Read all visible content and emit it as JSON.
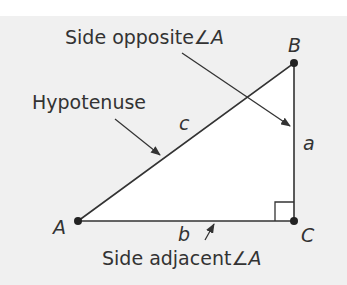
{
  "diagram": {
    "colors": {
      "background": "#f0f0f0",
      "triangle_fill": "#ffffff",
      "stroke": "#333333"
    },
    "vertices": [
      {
        "name": "A",
        "label": "A"
      },
      {
        "name": "B",
        "label": "B"
      },
      {
        "name": "C",
        "label": "C"
      }
    ],
    "sides": {
      "a": "a",
      "b": "b",
      "c": "c"
    },
    "annotations": {
      "opposite": "Side opposite",
      "hypotenuse": "Hypotenuse",
      "adjacent": "Side adjacent",
      "angle_symbol": "∠",
      "angle_letter": "A"
    }
  }
}
